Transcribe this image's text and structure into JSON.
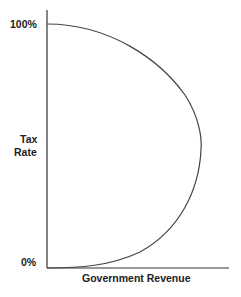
{
  "diagram": {
    "y_axis": {
      "label_line1": "Tax",
      "label_line2": "Rate",
      "tick_top": "100%",
      "tick_bottom": "0%"
    },
    "x_axis": {
      "label": "Government Revenue"
    },
    "colors": {
      "axis": "#333333",
      "curve": "#444444",
      "text": "#222222"
    }
  }
}
